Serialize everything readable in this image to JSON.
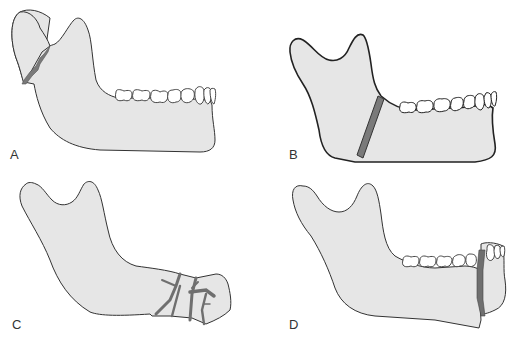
{
  "figure": {
    "colors": {
      "bone_fill": "#e6e6e6",
      "outline": "#333333",
      "fracture": "#7a7a7a",
      "tooth_fill": "#ffffff",
      "background": "#ffffff"
    },
    "panels": [
      {
        "label": "A",
        "description": "Condylar neck fracture"
      },
      {
        "label": "B",
        "description": "Angle fracture"
      },
      {
        "label": "C",
        "description": "Comminuted body/parasymphyseal fracture"
      },
      {
        "label": "D",
        "description": "Parasymphyseal fracture"
      }
    ]
  }
}
